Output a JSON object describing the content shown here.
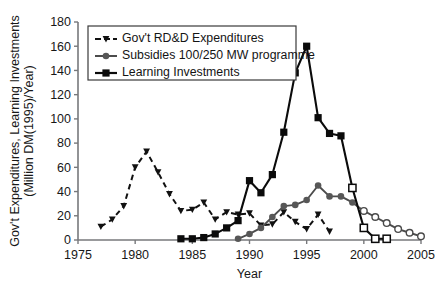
{
  "chart_data": {
    "type": "line",
    "title": "",
    "xlabel": "Year",
    "ylabel": "Gov't Expenditures, Learning Investments (Million DM(1995)/Year)",
    "ylabel_line1": "Gov't Expenditures, Learning Investments",
    "ylabel_line2": "(Million DM(1995)/Year)",
    "xlim": [
      1975,
      2005
    ],
    "ylim": [
      0,
      180
    ],
    "xticks": [
      1975,
      1980,
      1985,
      1990,
      1995,
      2000,
      2005
    ],
    "yticks": [
      0,
      20,
      40,
      60,
      80,
      100,
      120,
      140,
      160,
      180
    ],
    "grid": false,
    "legend_position": "upper-left",
    "series": [
      {
        "name": "Gov't RD&D Expenditures",
        "style": "dashed",
        "marker": "triangle",
        "color": "#111111",
        "x": [
          1977,
          1978,
          1979,
          1980,
          1981,
          1982,
          1983,
          1984,
          1985,
          1986,
          1987,
          1988,
          1989,
          1990,
          1991,
          1992,
          1993,
          1994,
          1995,
          1996,
          1997
        ],
        "values": [
          11,
          17,
          28,
          60,
          73,
          56,
          38,
          24,
          25,
          31,
          17,
          23,
          21,
          22,
          12,
          13,
          23,
          15,
          9,
          21,
          7
        ]
      },
      {
        "name": "Subsidies 100/250 MW programme",
        "style": "solid",
        "marker": "circle",
        "color": "#575757",
        "x": [
          1989,
          1990,
          1991,
          1992,
          1993,
          1994,
          1995,
          1996,
          1997,
          1998,
          1999,
          2000,
          2001,
          2002,
          2003,
          2004,
          2005
        ],
        "values": [
          1,
          5,
          10,
          19,
          28,
          29,
          33,
          45,
          36,
          36,
          31,
          24,
          19,
          14,
          9,
          6,
          3
        ],
        "open_marker_from": 2000
      },
      {
        "name": "Learning Investments",
        "style": "solid",
        "marker": "square",
        "color": "#0b0b0b",
        "x": [
          1984,
          1985,
          1986,
          1987,
          1988,
          1989,
          1990,
          1991,
          1992,
          1993,
          1994,
          1995,
          1996,
          1997,
          1998,
          1999,
          2000,
          2001,
          2002
        ],
        "values": [
          1,
          1,
          2,
          5,
          10,
          16,
          49,
          39,
          54,
          89,
          138,
          160,
          101,
          88,
          86,
          43,
          10,
          1,
          1
        ],
        "open_marker_from": 1999
      }
    ]
  },
  "legend": {
    "items": [
      {
        "label": "Gov't RD&D Expenditures"
      },
      {
        "label": "Subsidies  100/250 MW programme"
      },
      {
        "label": "Learning Investments"
      }
    ]
  }
}
